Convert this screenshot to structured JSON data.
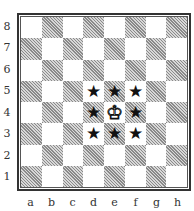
{
  "diagram": {
    "type": "chessboard",
    "ranks": [
      "8",
      "7",
      "6",
      "5",
      "4",
      "3",
      "2",
      "1"
    ],
    "files": [
      "a",
      "b",
      "c",
      "d",
      "e",
      "f",
      "g",
      "h"
    ],
    "pieces": [
      {
        "square": "e4",
        "piece": "white-king",
        "glyph": "♔"
      },
      {
        "square": "d5",
        "piece": "star-marker",
        "glyph": "★"
      },
      {
        "square": "e5",
        "piece": "star-marker",
        "glyph": "★"
      },
      {
        "square": "f5",
        "piece": "star-marker",
        "glyph": "★"
      },
      {
        "square": "d4",
        "piece": "star-marker",
        "glyph": "★"
      },
      {
        "square": "f4",
        "piece": "star-marker",
        "glyph": "★"
      },
      {
        "square": "d3",
        "piece": "star-marker",
        "glyph": "★"
      },
      {
        "square": "e3",
        "piece": "star-marker",
        "glyph": "★"
      },
      {
        "square": "f3",
        "piece": "star-marker",
        "glyph": "★"
      }
    ],
    "colors": {
      "light": "#ffffff",
      "dark_hatch": "#8a8a8a",
      "border": "#333333"
    }
  }
}
